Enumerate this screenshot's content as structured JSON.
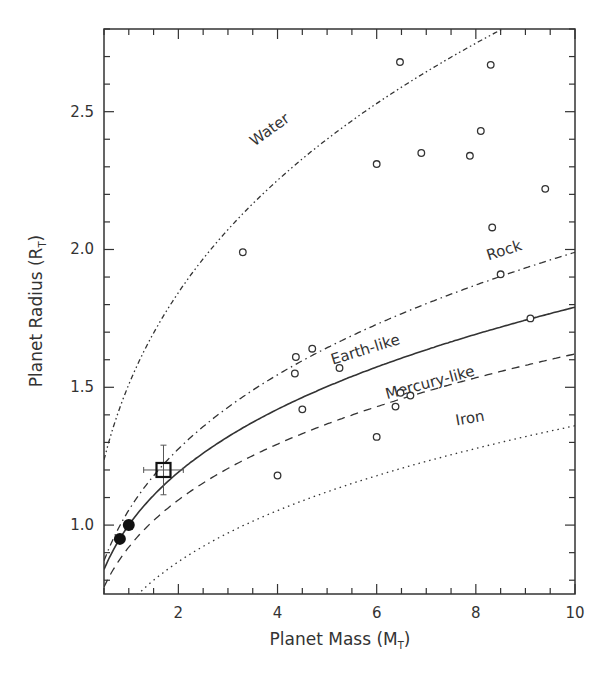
{
  "chart_data": {
    "type": "scatter",
    "title": "",
    "xlabel": "Planet Mass (M",
    "xlabel_sub": "T",
    "xlabel_close": ")",
    "ylabel": "Planet Radius (R",
    "ylabel_sub": "T",
    "ylabel_close": ")",
    "xlim": [
      0.5,
      10
    ],
    "ylim": [
      0.75,
      2.8
    ],
    "x_ticks": [
      2,
      4,
      6,
      8,
      10
    ],
    "x_tick_labels": [
      "2",
      "4",
      "6",
      "8",
      "10"
    ],
    "x_minor_step": 0.5,
    "y_ticks": [
      1.0,
      1.5,
      2.0,
      2.5
    ],
    "y_tick_labels": [
      "1.0",
      "1.5",
      "2.0",
      "2.5"
    ],
    "y_minor_step": 0.1,
    "grid": false,
    "legend": "none (curves labeled inline)",
    "curves": [
      {
        "name": "Water",
        "label": "Water",
        "style": "dash-dot-dot",
        "a": 1.51,
        "b": 0.288,
        "label_x": 3.9,
        "label_y": 2.42,
        "label_rot": -36
      },
      {
        "name": "Rock",
        "label": "Rock",
        "style": "dash-dot",
        "a": 1.054,
        "b": 0.276,
        "label_x": 8.6,
        "label_y": 1.98,
        "label_rot": -18
      },
      {
        "name": "Earth-like",
        "label": "Earth-like",
        "style": "solid",
        "a": 1.0,
        "b": 0.253,
        "label_x": 5.8,
        "label_y": 1.62,
        "label_rot": -17
      },
      {
        "name": "Mercury-like",
        "label": "Mercury-like",
        "style": "dashed",
        "a": 0.92,
        "b": 0.246,
        "label_x": 7.1,
        "label_y": 1.5,
        "label_rot": -15
      },
      {
        "name": "Iron",
        "label": "Iron",
        "style": "dotted",
        "a": 0.714,
        "b": 0.28,
        "label_x": 7.9,
        "label_y": 1.37,
        "label_rot": -10
      }
    ],
    "open_points": [
      {
        "x": 3.3,
        "y": 1.99
      },
      {
        "x": 4.0,
        "y": 1.18
      },
      {
        "x": 4.35,
        "y": 1.55
      },
      {
        "x": 4.37,
        "y": 1.61
      },
      {
        "x": 4.5,
        "y": 1.42
      },
      {
        "x": 4.7,
        "y": 1.64
      },
      {
        "x": 5.25,
        "y": 1.57
      },
      {
        "x": 6.0,
        "y": 2.31
      },
      {
        "x": 6.0,
        "y": 1.32
      },
      {
        "x": 6.38,
        "y": 1.43
      },
      {
        "x": 6.47,
        "y": 2.68
      },
      {
        "x": 6.48,
        "y": 1.48
      },
      {
        "x": 6.68,
        "y": 1.47
      },
      {
        "x": 6.9,
        "y": 2.35
      },
      {
        "x": 7.88,
        "y": 2.34
      },
      {
        "x": 8.1,
        "y": 2.43
      },
      {
        "x": 8.3,
        "y": 2.67
      },
      {
        "x": 8.33,
        "y": 2.08
      },
      {
        "x": 8.5,
        "y": 1.91
      },
      {
        "x": 9.1,
        "y": 1.75
      },
      {
        "x": 9.4,
        "y": 2.22
      }
    ],
    "filled_points": [
      {
        "x": 0.82,
        "y": 0.95
      },
      {
        "x": 1.0,
        "y": 1.0
      }
    ],
    "highlight_point": {
      "x": 1.7,
      "y": 1.2,
      "x_err": 0.4,
      "y_err": 0.09,
      "marker": "open-square"
    }
  }
}
